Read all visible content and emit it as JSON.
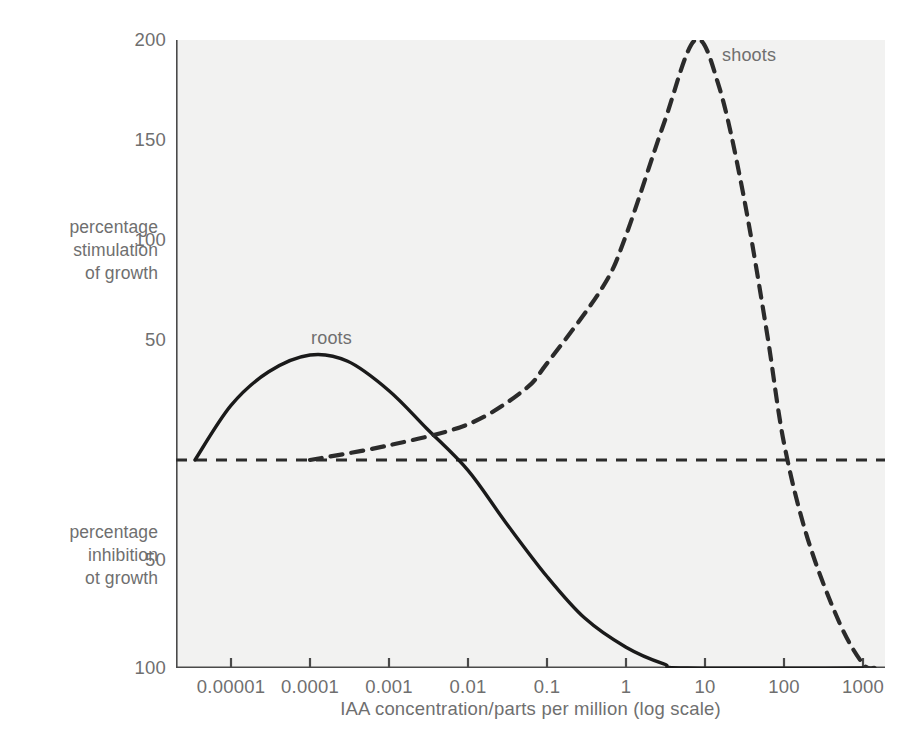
{
  "chart_data": {
    "type": "line",
    "title": "",
    "subtitle": "",
    "xlabel": "IAA concentration/parts per million (log scale)",
    "ylabel_upper": "percentage\nstimulation\nof growth",
    "ylabel_lower": "percentage\ninhibition\not growth",
    "xscale": "log",
    "xlim": [
      2e-06,
      2500
    ],
    "ylim": [
      -100,
      210
    ],
    "grid": false,
    "legend": "inline-curve-labels",
    "xticks": [
      {
        "value": 1e-05,
        "label": "0.00001"
      },
      {
        "value": 0.0001,
        "label": "0.0001"
      },
      {
        "value": 0.001,
        "label": "0.001"
      },
      {
        "value": 0.01,
        "label": "0.01"
      },
      {
        "value": 0.1,
        "label": "0.1"
      },
      {
        "value": 1,
        "label": "1"
      },
      {
        "value": 10,
        "label": "10"
      },
      {
        "value": 100,
        "label": "100"
      },
      {
        "value": 1000,
        "label": "1000"
      }
    ],
    "yticks": [
      {
        "value": 200,
        "label": "200"
      },
      {
        "value": 150,
        "label": "150"
      },
      {
        "value": 100,
        "label": "100"
      },
      {
        "value": 50,
        "label": "50"
      },
      {
        "value": -50,
        "label": "50"
      },
      {
        "value": -100,
        "label": "100"
      }
    ],
    "zero_line": {
      "value": 0,
      "style": "dashed",
      "color": "#2b2b2b"
    },
    "series": [
      {
        "name": "roots",
        "label": "roots",
        "style": "solid",
        "color": "#1a1a1a",
        "points": [
          {
            "x": 3.5e-06,
            "y": 0
          },
          {
            "x": 1e-05,
            "y": 26
          },
          {
            "x": 3e-05,
            "y": 42
          },
          {
            "x": 0.0001,
            "y": 50
          },
          {
            "x": 0.0003,
            "y": 47
          },
          {
            "x": 0.001,
            "y": 33
          },
          {
            "x": 0.003,
            "y": 15
          },
          {
            "x": 0.01,
            "y": -5
          },
          {
            "x": 0.03,
            "y": -30
          },
          {
            "x": 0.1,
            "y": -56
          },
          {
            "x": 0.3,
            "y": -76
          },
          {
            "x": 1,
            "y": -90
          },
          {
            "x": 3,
            "y": -98
          },
          {
            "x": 6,
            "y": -100
          },
          {
            "x": 1000,
            "y": -100
          }
        ]
      },
      {
        "name": "shoots",
        "label": "shoots",
        "style": "dashed",
        "color": "#2b2b2b",
        "points": [
          {
            "x": 0.0001,
            "y": 0
          },
          {
            "x": 0.001,
            "y": 7
          },
          {
            "x": 0.01,
            "y": 17
          },
          {
            "x": 0.05,
            "y": 33
          },
          {
            "x": 0.1,
            "y": 46
          },
          {
            "x": 0.5,
            "y": 82
          },
          {
            "x": 1,
            "y": 107
          },
          {
            "x": 3,
            "y": 160
          },
          {
            "x": 7.5,
            "y": 200
          },
          {
            "x": 15,
            "y": 178
          },
          {
            "x": 30,
            "y": 128
          },
          {
            "x": 60,
            "y": 62
          },
          {
            "x": 100,
            "y": 8
          },
          {
            "x": 200,
            "y": -38
          },
          {
            "x": 500,
            "y": -78
          },
          {
            "x": 1000,
            "y": -98
          },
          {
            "x": 1400,
            "y": -100
          }
        ]
      }
    ],
    "annotations": [
      {
        "text": "roots",
        "x": 0.0001,
        "y": 62
      },
      {
        "text": "shoots",
        "x": 20,
        "y": 192
      }
    ]
  },
  "colors": {
    "plot_background": "#f2f2f1",
    "page_background": "#ffffff",
    "axis": "#4a4a4a",
    "text": "#6f6f6f",
    "roots_curve": "#1a1a1a",
    "shoots_curve": "#2b2b2b"
  }
}
